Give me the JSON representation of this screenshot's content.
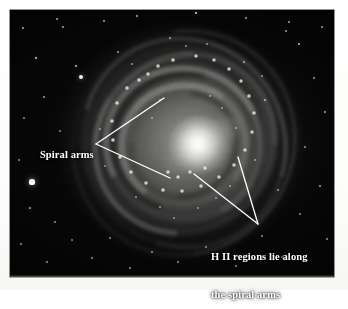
{
  "figure": {
    "kind": "annotated-astronomical-photograph",
    "background_color": "#050505",
    "annotation_color": "#ffffff",
    "page_color": "#fdfdfb"
  },
  "annotations": [
    {
      "id": "spiral-arms",
      "text": "Spiral arms",
      "lines": 1,
      "line1": "Spiral arms",
      "pointer_style": "two-branch-leader",
      "pointer_vertex": {
        "x": 96,
        "y": 144
      },
      "pointer_targets": [
        {
          "x": 164,
          "y": 98
        },
        {
          "x": 170,
          "y": 178
        }
      ]
    },
    {
      "id": "hii-regions",
      "text": "H II regions lie along the spiral arms",
      "lines": 2,
      "line1": "H II regions lie along",
      "line2": "the spiral arms",
      "pointer_style": "two-branch-leader",
      "pointer_vertex": {
        "x": 258,
        "y": 224
      },
      "pointer_targets": [
        {
          "x": 194,
          "y": 174
        },
        {
          "x": 238,
          "y": 157
        }
      ]
    }
  ],
  "photo": {
    "left": 10,
    "top": 10,
    "width": 324,
    "height": 267
  },
  "galaxy": {
    "nucleus": {
      "x": 189,
      "y": 135
    },
    "halo_extent": {
      "x": 52,
      "y": 14,
      "width": 238,
      "height": 236
    },
    "description": "face-on barred spiral with bright nucleus, multiple spiral arms, dark dust lanes and numerous bright H II knots"
  },
  "field_stars": [
    {
      "x": 32,
      "y": 182,
      "r": 2.6,
      "b": 1.0
    },
    {
      "x": 36,
      "y": 58,
      "r": 1.3,
      "b": 0.8
    },
    {
      "x": 81,
      "y": 77,
      "r": 2.1,
      "b": 0.95
    },
    {
      "x": 76,
      "y": 66,
      "r": 1.2,
      "b": 0.72
    },
    {
      "x": 23,
      "y": 28,
      "r": 0.9,
      "b": 0.62
    },
    {
      "x": 57,
      "y": 19,
      "r": 0.9,
      "b": 0.6
    },
    {
      "x": 63,
      "y": 27,
      "r": 0.8,
      "b": 0.55
    },
    {
      "x": 104,
      "y": 21,
      "r": 0.8,
      "b": 0.55
    },
    {
      "x": 137,
      "y": 16,
      "r": 1.0,
      "b": 0.65
    },
    {
      "x": 196,
      "y": 13,
      "r": 1.4,
      "b": 0.85
    },
    {
      "x": 246,
      "y": 18,
      "r": 0.9,
      "b": 0.58
    },
    {
      "x": 289,
      "y": 22,
      "r": 1.0,
      "b": 0.62
    },
    {
      "x": 322,
      "y": 27,
      "r": 0.9,
      "b": 0.58
    },
    {
      "x": 299,
      "y": 44,
      "r": 1.2,
      "b": 0.7
    },
    {
      "x": 286,
      "y": 31,
      "r": 0.8,
      "b": 0.52
    },
    {
      "x": 314,
      "y": 78,
      "r": 0.9,
      "b": 0.55
    },
    {
      "x": 325,
      "y": 112,
      "r": 1.0,
      "b": 0.6
    },
    {
      "x": 305,
      "y": 147,
      "r": 0.9,
      "b": 0.55
    },
    {
      "x": 320,
      "y": 186,
      "r": 1.0,
      "b": 0.6
    },
    {
      "x": 300,
      "y": 214,
      "r": 0.9,
      "b": 0.52
    },
    {
      "x": 327,
      "y": 239,
      "r": 0.9,
      "b": 0.55
    },
    {
      "x": 282,
      "y": 257,
      "r": 0.9,
      "b": 0.52
    },
    {
      "x": 236,
      "y": 266,
      "r": 0.9,
      "b": 0.5
    },
    {
      "x": 178,
      "y": 262,
      "r": 0.9,
      "b": 0.52
    },
    {
      "x": 130,
      "y": 268,
      "r": 0.8,
      "b": 0.48
    },
    {
      "x": 92,
      "y": 258,
      "r": 0.9,
      "b": 0.52
    },
    {
      "x": 47,
      "y": 262,
      "r": 1.0,
      "b": 0.56
    },
    {
      "x": 21,
      "y": 244,
      "r": 0.9,
      "b": 0.52
    },
    {
      "x": 30,
      "y": 208,
      "r": 1.1,
      "b": 0.62
    },
    {
      "x": 19,
      "y": 160,
      "r": 0.9,
      "b": 0.52
    },
    {
      "x": 24,
      "y": 118,
      "r": 0.9,
      "b": 0.52
    },
    {
      "x": 44,
      "y": 97,
      "r": 1.0,
      "b": 0.58
    },
    {
      "x": 60,
      "y": 131,
      "r": 0.9,
      "b": 0.5
    },
    {
      "x": 55,
      "y": 222,
      "r": 1.0,
      "b": 0.56
    },
    {
      "x": 72,
      "y": 240,
      "r": 0.8,
      "b": 0.46
    },
    {
      "x": 110,
      "y": 238,
      "r": 0.9,
      "b": 0.5
    },
    {
      "x": 152,
      "y": 252,
      "r": 0.9,
      "b": 0.5
    },
    {
      "x": 206,
      "y": 247,
      "r": 0.9,
      "b": 0.5
    },
    {
      "x": 262,
      "y": 236,
      "r": 0.9,
      "b": 0.5
    },
    {
      "x": 278,
      "y": 190,
      "r": 1.0,
      "b": 0.56
    },
    {
      "x": 265,
      "y": 100,
      "r": 1.1,
      "b": 0.64
    },
    {
      "x": 244,
      "y": 62,
      "r": 1.0,
      "b": 0.6
    },
    {
      "x": 170,
      "y": 38,
      "r": 0.9,
      "b": 0.55
    },
    {
      "x": 118,
      "y": 52,
      "r": 1.0,
      "b": 0.58
    }
  ],
  "hii_knots": [
    {
      "x": 148,
      "y": 74,
      "r": 2.0
    },
    {
      "x": 158,
      "y": 66,
      "r": 1.7
    },
    {
      "x": 173,
      "y": 60,
      "r": 1.6
    },
    {
      "x": 196,
      "y": 56,
      "r": 1.9
    },
    {
      "x": 214,
      "y": 60,
      "r": 2.1
    },
    {
      "x": 229,
      "y": 69,
      "r": 1.8
    },
    {
      "x": 241,
      "y": 81,
      "r": 2.0
    },
    {
      "x": 249,
      "y": 96,
      "r": 1.6
    },
    {
      "x": 254,
      "y": 113,
      "r": 1.8
    },
    {
      "x": 252,
      "y": 132,
      "r": 1.7
    },
    {
      "x": 245,
      "y": 150,
      "r": 2.0
    },
    {
      "x": 234,
      "y": 165,
      "r": 1.8
    },
    {
      "x": 219,
      "y": 177,
      "r": 1.9
    },
    {
      "x": 201,
      "y": 186,
      "r": 1.7
    },
    {
      "x": 182,
      "y": 191,
      "r": 1.8
    },
    {
      "x": 163,
      "y": 190,
      "r": 1.6
    },
    {
      "x": 146,
      "y": 183,
      "r": 1.9
    },
    {
      "x": 131,
      "y": 172,
      "r": 1.7
    },
    {
      "x": 120,
      "y": 157,
      "r": 1.8
    },
    {
      "x": 113,
      "y": 140,
      "r": 1.6
    },
    {
      "x": 112,
      "y": 121,
      "r": 1.7
    },
    {
      "x": 117,
      "y": 103,
      "r": 1.8
    },
    {
      "x": 127,
      "y": 88,
      "r": 1.7
    },
    {
      "x": 139,
      "y": 80,
      "r": 1.6
    },
    {
      "x": 190,
      "y": 172,
      "r": 2.2
    },
    {
      "x": 205,
      "y": 168,
      "r": 1.8
    },
    {
      "x": 178,
      "y": 177,
      "r": 1.9
    },
    {
      "x": 168,
      "y": 172,
      "r": 1.6
    },
    {
      "x": 210,
      "y": 96,
      "r": 1.5
    },
    {
      "x": 222,
      "y": 108,
      "r": 1.4
    },
    {
      "x": 160,
      "y": 100,
      "r": 1.4
    },
    {
      "x": 152,
      "y": 118,
      "r": 1.3
    },
    {
      "x": 236,
      "y": 128,
      "r": 1.5
    },
    {
      "x": 198,
      "y": 208,
      "r": 1.5
    },
    {
      "x": 216,
      "y": 198,
      "r": 1.4
    },
    {
      "x": 160,
      "y": 207,
      "r": 1.5
    },
    {
      "x": 136,
      "y": 197,
      "r": 1.4
    },
    {
      "x": 100,
      "y": 129,
      "r": 1.4
    },
    {
      "x": 105,
      "y": 166,
      "r": 1.3
    },
    {
      "x": 262,
      "y": 76,
      "r": 1.4
    },
    {
      "x": 186,
      "y": 46,
      "r": 1.5
    },
    {
      "x": 207,
      "y": 44,
      "r": 1.3
    },
    {
      "x": 132,
      "y": 64,
      "r": 1.4
    },
    {
      "x": 255,
      "y": 160,
      "r": 1.3
    },
    {
      "x": 174,
      "y": 218,
      "r": 1.4
    },
    {
      "x": 230,
      "y": 186,
      "r": 1.3
    }
  ]
}
